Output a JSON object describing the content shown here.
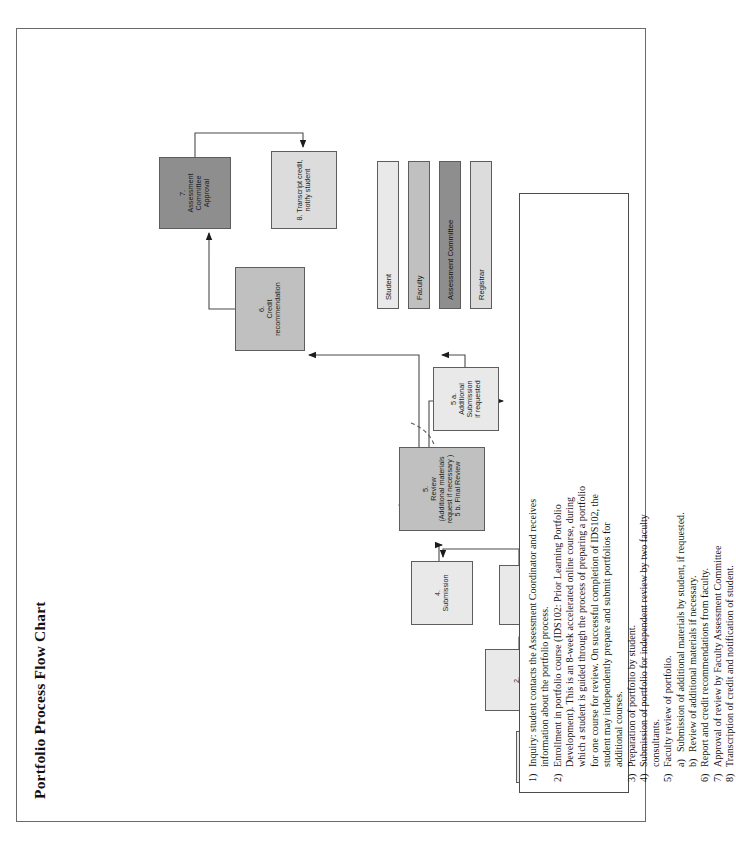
{
  "document": {
    "title": "Portfolio Process Flow Chart"
  },
  "flow_nodes": [
    {
      "id": "n1",
      "label": "1.\nInquiry",
      "role": "student"
    },
    {
      "id": "n2",
      "label": "2.\nEnrollment",
      "role": "student"
    },
    {
      "id": "n3",
      "label": "3.\nPreparation",
      "role": "student"
    },
    {
      "id": "n4",
      "label": "4.\nSubmission",
      "role": "student"
    },
    {
      "id": "n5",
      "label": "5.\nReview\n(Additional materials\nrequest if necessary )\n5 b. Final Review",
      "role": "faculty"
    },
    {
      "id": "n5a",
      "label": "5 a.\nAdditional\nSubmission\nif requested",
      "role": "student"
    },
    {
      "id": "n6",
      "label": "6.\nCredit\nrecommendation",
      "role": "faculty"
    },
    {
      "id": "n7",
      "label": "7.\nAssessment\nCommittee\nApproval",
      "role": "committee"
    },
    {
      "id": "n8",
      "label": "8. Transcript credit,\nnotify student",
      "role": "registrar"
    }
  ],
  "legend": {
    "items": [
      {
        "label": "Student",
        "color": "#e9e9e9"
      },
      {
        "label": "Faculty",
        "color": "#c0c0c0"
      },
      {
        "label": "Assessment Committee",
        "color": "#8e8e8e"
      },
      {
        "label": "Registrar",
        "color": "#dcdcdc"
      }
    ]
  },
  "notes": {
    "items": [
      {
        "num": "1)",
        "text": "Inquiry: student contacts the Assessment Coordinator and receives"
      },
      {
        "num": "",
        "text": "information about the portfolio process."
      },
      {
        "num": "2)",
        "text": "Enrollment in portfolio course (IDS102: Prior Learning Portfolio"
      },
      {
        "num": "",
        "text": "Development).  This is an 8-week accelerated online course, during"
      },
      {
        "num": "",
        "text": "which a student is guided through the process of preparing a portfolio"
      },
      {
        "num": "",
        "text": "for one course for review.  On successful completion of IDS102, the"
      },
      {
        "num": "",
        "text": "student may independently prepare and submit portfolios for"
      },
      {
        "num": "",
        "text": "additional courses."
      },
      {
        "num": "3)",
        "text": "Preparation of portfolio by student."
      },
      {
        "num": "4)",
        "text": "Submission of portfolio for independent review by two faculty"
      },
      {
        "num": "",
        "text": "consultants."
      },
      {
        "num": "5)",
        "text": "Faculty review of portfolio."
      },
      {
        "num": "a)",
        "text": "Submission of additional materials by student, if requested."
      },
      {
        "num": "b)",
        "text": "Review of additional materials if necessary."
      },
      {
        "num": "6)",
        "text": "Report and credit recommendations from faculty."
      },
      {
        "num": "7)",
        "text": "Approval of review by Faculty Assessment Committee"
      },
      {
        "num": "8)",
        "text": "Transcription of credit and notification of student."
      }
    ]
  }
}
